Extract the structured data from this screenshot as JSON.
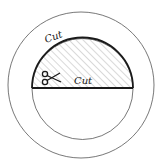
{
  "diagram": {
    "labels": {
      "arc_cut": "Cut",
      "line_cut": "Cut"
    },
    "icons": [
      "scissors-icon"
    ],
    "colors": {
      "stroke": "#1a1a1a",
      "thin_stroke": "#555555",
      "hatch": "#9a9a9a",
      "background": "#ffffff"
    }
  }
}
